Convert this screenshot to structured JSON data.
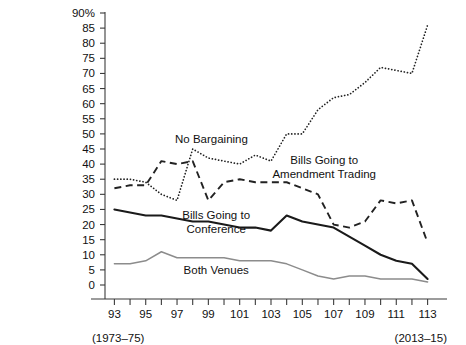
{
  "chart_data": {
    "type": "line",
    "title": "",
    "subtitle": "",
    "xlabel": "",
    "ylabel": "",
    "xlim": [
      92.4,
      113.6
    ],
    "ylim": [
      0,
      90
    ],
    "grid": false,
    "legend_position": "inline-annotations",
    "y_ticks": [
      0,
      5,
      10,
      15,
      20,
      25,
      30,
      35,
      40,
      45,
      50,
      55,
      60,
      65,
      70,
      75,
      80,
      85,
      90
    ],
    "y_tick_labels": [
      "0",
      "5",
      "10",
      "15",
      "20",
      "25",
      "30",
      "35",
      "40",
      "45",
      "50",
      "55",
      "60",
      "65",
      "70",
      "75",
      "80",
      "85",
      "90%"
    ],
    "x_ticks": [
      93,
      94,
      95,
      96,
      97,
      98,
      99,
      100,
      101,
      102,
      103,
      104,
      105,
      106,
      107,
      108,
      109,
      110,
      111,
      112,
      113
    ],
    "x_tick_labels": [
      "93",
      "",
      "95",
      "",
      "97",
      "",
      "99",
      "",
      "101",
      "",
      "103",
      "",
      "105",
      "",
      "107",
      "",
      "109",
      "",
      "111",
      "",
      "113"
    ],
    "x": [
      93,
      94,
      95,
      96,
      97,
      98,
      99,
      100,
      101,
      102,
      103,
      104,
      105,
      106,
      107,
      108,
      109,
      110,
      111,
      112,
      113
    ],
    "annotations": [
      {
        "text": "(1973–75)",
        "x": 93,
        "position": "below-axis-left"
      },
      {
        "text": "(2013–15)",
        "x": 113,
        "position": "below-axis-right"
      }
    ],
    "series": [
      {
        "name": "No Bargaining",
        "style": "dotted",
        "color": "#222222",
        "label": "No Bargaining",
        "label_x": 99.2,
        "label_y": 47,
        "values": [
          35,
          35,
          34,
          30,
          28,
          45,
          42,
          41,
          40,
          43,
          41,
          50,
          50,
          58,
          62,
          63,
          67,
          72,
          71,
          70,
          86
        ]
      },
      {
        "name": "Bills Going to Amendment Trading",
        "style": "dashed",
        "color": "#222222",
        "label": "Bills Going to\nAmendment Trading",
        "label_line1": "Bills Going to",
        "label_line2": "Amendment Trading",
        "label_x": 106.4,
        "label_y": 40,
        "values": [
          32,
          33,
          33,
          41,
          40,
          41,
          28,
          34,
          35,
          34,
          34,
          34,
          32,
          30,
          20,
          19,
          21,
          28,
          27,
          28,
          14
        ]
      },
      {
        "name": "Bills Going to Conference",
        "style": "solid",
        "color": "#1a1a1a",
        "label": "Bills Going to\nConference",
        "label_line1": "Bills Going to",
        "label_line2": "Conference",
        "label_x": 99.5,
        "label_y": 22,
        "values": [
          25,
          24,
          23,
          23,
          22,
          21,
          21,
          20,
          19,
          19,
          18,
          23,
          21,
          20,
          19,
          16,
          13,
          10,
          8,
          7,
          2
        ]
      },
      {
        "name": "Both Venues",
        "style": "solid-gray",
        "color": "#8c8c8c",
        "label": "Both Venues",
        "label_x": 99.5,
        "label_y": 3.5,
        "values": [
          7,
          7,
          8,
          11,
          9,
          9,
          9,
          9,
          8,
          8,
          8,
          7,
          5,
          3,
          2,
          3,
          3,
          2,
          2,
          2,
          1
        ]
      }
    ]
  }
}
